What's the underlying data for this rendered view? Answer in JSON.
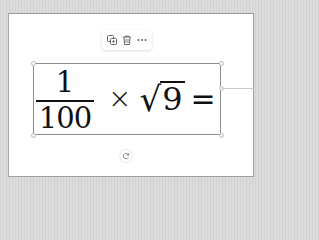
{
  "toolbar": {
    "buttons": [
      {
        "name": "duplicate",
        "icon": "copy-icon"
      },
      {
        "name": "delete",
        "icon": "trash-icon"
      },
      {
        "name": "more",
        "icon": "more-horizontal-icon",
        "label": "···"
      }
    ]
  },
  "equation": {
    "numerator": "1",
    "denominator": "100",
    "times": "×",
    "radical": "√",
    "radicand": "9",
    "equals": "="
  },
  "rotate": {
    "icon": "rotate-icon"
  },
  "colors": {
    "background": "#d6d6d6",
    "card": "#ffffff",
    "selection_border": "#8c8c8c",
    "text": "#111111"
  }
}
